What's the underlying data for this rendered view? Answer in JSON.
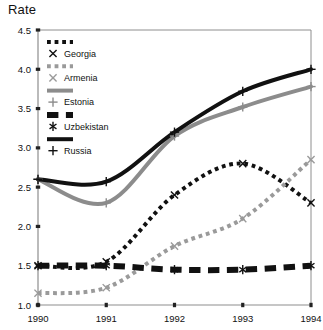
{
  "chart_data": {
    "type": "line",
    "title": "Rate",
    "xlabel": "",
    "ylabel": "Rate",
    "x": [
      1990,
      1991,
      1992,
      1993,
      1994
    ],
    "categories": [
      "1990",
      "1991",
      "1992",
      "1993",
      "1994"
    ],
    "xlim": [
      1990,
      1994
    ],
    "ylim": [
      1.0,
      4.5
    ],
    "yticks": [
      1.0,
      1.5,
      2.0,
      2.5,
      3.0,
      3.5,
      4.0,
      4.5
    ],
    "ytick_labels": [
      "1.0",
      "1.5",
      "2.0",
      "2.5",
      "3.0",
      "3.5",
      "4.0",
      "4.5"
    ],
    "xticks": [
      1990,
      1991,
      1992,
      1993,
      1994
    ],
    "xtick_labels": [
      "1990",
      "1991",
      "1992",
      "1993",
      "1994"
    ],
    "grid": false,
    "legend_position": "upper-left-inside",
    "series": [
      {
        "name": "Georgia",
        "values": [
          1.5,
          1.55,
          2.4,
          2.8,
          2.3
        ],
        "color": "#111111",
        "style": "dotted",
        "marker": "x",
        "width": 4
      },
      {
        "name": "Armenia",
        "values": [
          1.15,
          1.22,
          1.75,
          2.1,
          2.85
        ],
        "color": "#9a9a9a",
        "style": "dotted",
        "marker": "x",
        "width": 4
      },
      {
        "name": "Estonia",
        "values": [
          2.6,
          2.3,
          3.15,
          3.52,
          3.78
        ],
        "color": "#8c8c8c",
        "style": "solid",
        "marker": "plus",
        "width": 4
      },
      {
        "name": "Uzbekistan",
        "values": [
          1.5,
          1.5,
          1.45,
          1.45,
          1.5
        ],
        "color": "#111111",
        "style": "dashed",
        "marker": "asterisk",
        "width": 6
      },
      {
        "name": "Russia",
        "values": [
          2.6,
          2.57,
          3.2,
          3.72,
          4.0
        ],
        "color": "#111111",
        "style": "solid",
        "marker": "plus",
        "width": 4
      }
    ]
  },
  "legend": {
    "entries": [
      {
        "label": "Georgia",
        "marker_name": "x-marker"
      },
      {
        "label": "Armenia",
        "marker_name": "x-marker"
      },
      {
        "label": "Estonia",
        "marker_name": "plus-marker"
      },
      {
        "label": "Uzbekistan",
        "marker_name": "asterisk-marker"
      },
      {
        "label": "Russia",
        "marker_name": "plus-marker"
      }
    ]
  },
  "axes": {
    "frame_color": "#8e8e8e",
    "tick_color": "#222222"
  }
}
